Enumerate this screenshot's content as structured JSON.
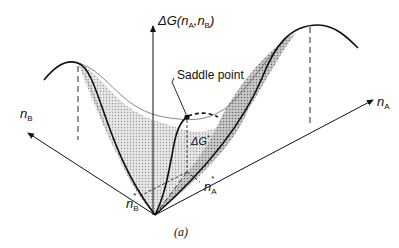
{
  "figure": {
    "caption": "(a)",
    "vertical_axis": {
      "label_prefix": "ΔG(",
      "label_var1": "n",
      "label_sub1": "A",
      "label_sep": ",",
      "label_var2": "n",
      "label_sub2": "B",
      "label_suffix": ")"
    },
    "axis_a": {
      "var": "n",
      "sub": "A"
    },
    "axis_b": {
      "var": "n",
      "sub": "B"
    },
    "saddle_point": {
      "label": "Saddle point"
    },
    "barrier": {
      "var": "ΔG",
      "sup": "*"
    },
    "na_star": {
      "var": "n",
      "sub": "A",
      "sup": "*"
    },
    "nb_star": {
      "var": "n",
      "sub": "B",
      "sup": "*"
    },
    "colors": {
      "line": "#111111",
      "surface_fill": "#d9d9d9",
      "surface_fill_dark": "#b8b8b8",
      "background": "#ffffff"
    }
  }
}
